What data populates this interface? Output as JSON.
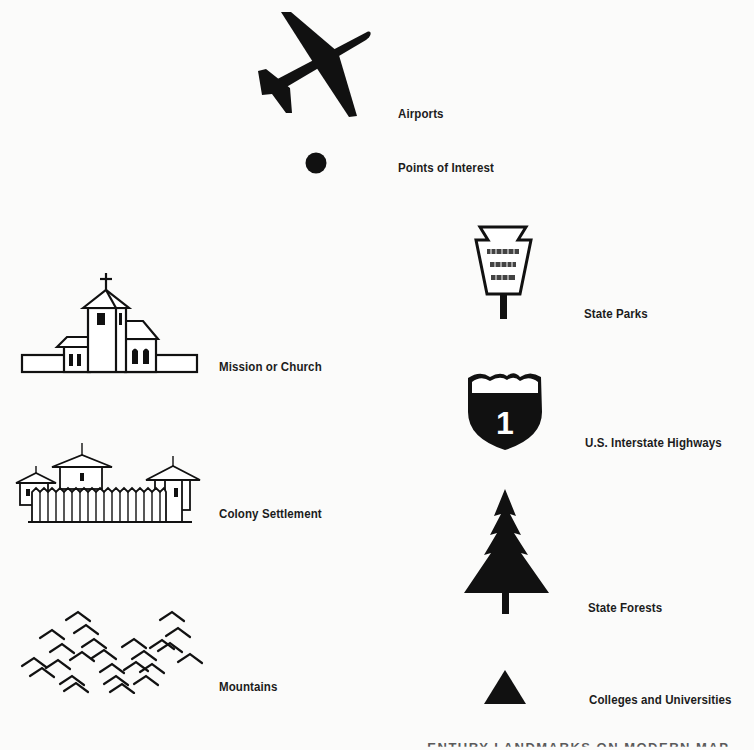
{
  "legend": {
    "items": [
      {
        "id": "airports",
        "label": "Airports",
        "icon": "airplane-icon"
      },
      {
        "id": "points-of-interest",
        "label": "Points of Interest",
        "icon": "dot-icon"
      },
      {
        "id": "state-parks",
        "label": "State Parks",
        "icon": "keystone-sign-icon"
      },
      {
        "id": "mission-or-church",
        "label": "Mission or Church",
        "icon": "church-icon"
      },
      {
        "id": "interstate-highways",
        "label": "U.S. Interstate Highways",
        "icon": "interstate-shield-icon",
        "shield_number": "1"
      },
      {
        "id": "colony-settlement",
        "label": "Colony Settlement",
        "icon": "fort-icon"
      },
      {
        "id": "state-forests",
        "label": "State Forests",
        "icon": "pine-tree-icon"
      },
      {
        "id": "mountains",
        "label": "Mountains",
        "icon": "mountains-icon"
      },
      {
        "id": "colleges-and-universities",
        "label": "Colleges and Universities",
        "icon": "triangle-icon"
      }
    ],
    "cutoff_caption": "...ENTURY LANDMARKS ON MODERN MAP"
  },
  "colors": {
    "background": "#fbfbfa",
    "ink": "#111111"
  }
}
